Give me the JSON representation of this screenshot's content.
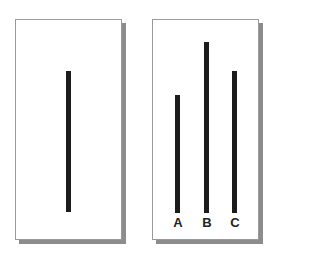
{
  "reference_card": {
    "line": {
      "x": 66,
      "top": 71,
      "bottom": 212,
      "width": 5
    }
  },
  "comparison_card": {
    "lines": [
      {
        "label": "A",
        "x": 175,
        "top": 95,
        "bottom": 213,
        "width": 5
      },
      {
        "label": "B",
        "x": 204,
        "top": 42,
        "bottom": 213,
        "width": 5
      },
      {
        "label": "C",
        "x": 232,
        "top": 71,
        "bottom": 213,
        "width": 5
      }
    ]
  },
  "colors": {
    "line": "#1c1c1c",
    "card_border": "#9a9a9a",
    "shadow": "#8c8c8c"
  }
}
